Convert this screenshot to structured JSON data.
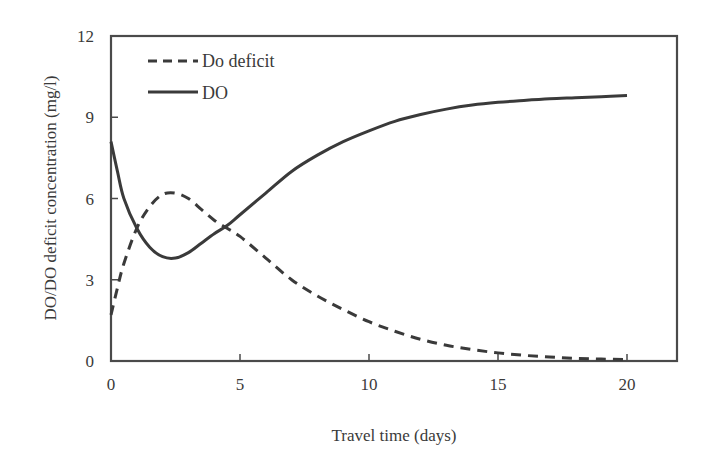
{
  "chart_data": {
    "type": "line",
    "title": "",
    "xlabel": "Travel time (days)",
    "ylabel": "DO/DO deficit concentration (mg/l)",
    "xlim": [
      0,
      22
    ],
    "ylim": [
      0,
      12
    ],
    "xticks": [
      0,
      5,
      10,
      15,
      20
    ],
    "yticks": [
      0,
      3,
      6,
      9,
      12
    ],
    "grid": false,
    "legend_position": "upper left",
    "legend": [
      "Do deficit",
      "DO"
    ],
    "series": [
      {
        "name": "Do deficit",
        "style": "dashed",
        "color": "#3a3a3a",
        "x": [
          0,
          0.25,
          0.5,
          1,
          1.5,
          2,
          2.5,
          3,
          3.5,
          4,
          4.5,
          5,
          6,
          7,
          8,
          9,
          10,
          11,
          12,
          13,
          14,
          15,
          16,
          17,
          18,
          19,
          20
        ],
        "y": [
          1.7,
          2.7,
          3.6,
          4.9,
          5.7,
          6.15,
          6.2,
          6.0,
          5.6,
          5.2,
          4.9,
          4.6,
          3.8,
          3.0,
          2.4,
          1.9,
          1.45,
          1.1,
          0.8,
          0.58,
          0.42,
          0.3,
          0.21,
          0.15,
          0.1,
          0.07,
          0.05
        ]
      },
      {
        "name": "DO",
        "style": "solid",
        "color": "#3a3a3a",
        "x": [
          0,
          0.25,
          0.5,
          1,
          1.5,
          2,
          2.5,
          3,
          3.5,
          4,
          4.5,
          5,
          6,
          7,
          8,
          9,
          10,
          11,
          12,
          13,
          14,
          15,
          16,
          17,
          18,
          19,
          20
        ],
        "y": [
          8.1,
          7.0,
          6.0,
          4.9,
          4.2,
          3.85,
          3.8,
          4.0,
          4.35,
          4.7,
          5.0,
          5.4,
          6.2,
          7.0,
          7.6,
          8.1,
          8.5,
          8.85,
          9.1,
          9.3,
          9.45,
          9.55,
          9.62,
          9.68,
          9.72,
          9.76,
          9.8
        ]
      }
    ]
  },
  "axes": {
    "x_tick_labels": [
      "0",
      "5",
      "10",
      "15",
      "20"
    ],
    "y_tick_labels": [
      "0",
      "3",
      "6",
      "9",
      "12"
    ],
    "xlabel": "Travel time (days)",
    "ylabel": "DO/DO deficit concentration (mg/l)"
  },
  "legend": {
    "items": [
      {
        "label": "Do deficit",
        "style": "dashed"
      },
      {
        "label": "DO",
        "style": "solid"
      }
    ]
  },
  "colors": {
    "line": "#3a3a3a",
    "axis": "#4a4a4a",
    "background": "#ffffff"
  }
}
